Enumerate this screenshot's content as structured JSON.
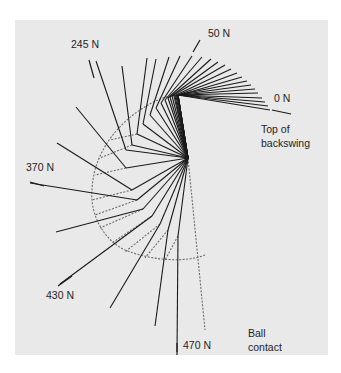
{
  "figure": {
    "background_color": "#e9e9e9",
    "line_color": "#1a1a1a",
    "dotted_color": "#6a6a6a"
  },
  "labels": {
    "force_0": "0 N",
    "force_50": "50 N",
    "force_245": "245 N",
    "force_370": "370 N",
    "force_430": "430 N",
    "force_470": "470 N",
    "top_of_backswing_line1": "Top of",
    "top_of_backswing_line2": "backswing",
    "ball_contact_line1": "Ball",
    "ball_contact_line2": "contact"
  },
  "swing": {
    "hub": [
      188,
      158
    ],
    "positions": [
      {
        "wrist": [
          178,
          95
        ],
        "club": [
          270,
          110
        ]
      },
      {
        "wrist": [
          178,
          95
        ],
        "club": [
          268,
          106
        ]
      },
      {
        "wrist": [
          178,
          95
        ],
        "club": [
          265,
          102
        ]
      },
      {
        "wrist": [
          178,
          95
        ],
        "club": [
          262,
          98
        ]
      },
      {
        "wrist": [
          178,
          95
        ],
        "club": [
          258,
          93
        ]
      },
      {
        "wrist": [
          178,
          95
        ],
        "club": [
          255,
          89
        ]
      },
      {
        "wrist": [
          177,
          95
        ],
        "club": [
          251,
          85
        ]
      },
      {
        "wrist": [
          177,
          95
        ],
        "club": [
          247,
          81
        ]
      },
      {
        "wrist": [
          176,
          96
        ],
        "club": [
          242,
          77
        ]
      },
      {
        "wrist": [
          175,
          96
        ],
        "club": [
          237,
          73
        ]
      },
      {
        "wrist": [
          174,
          96
        ],
        "club": [
          231,
          69
        ]
      },
      {
        "wrist": [
          172,
          96
        ],
        "club": [
          225,
          65
        ]
      },
      {
        "wrist": [
          170,
          97
        ],
        "club": [
          218,
          62
        ]
      },
      {
        "wrist": [
          168,
          98
        ],
        "club": [
          211,
          59
        ]
      },
      {
        "wrist": [
          165,
          100
        ],
        "club": [
          202,
          57
        ]
      },
      {
        "wrist": [
          161,
          103
        ],
        "club": [
          192,
          56
        ]
      },
      {
        "wrist": [
          156,
          108
        ],
        "club": [
          180,
          56
        ]
      },
      {
        "wrist": [
          150,
          115
        ],
        "club": [
          169,
          57
        ]
      },
      {
        "wrist": [
          143,
          124
        ],
        "club": [
          156,
          59
        ],
        "label": "force_50_line"
      },
      {
        "wrist": [
          137,
          134
        ],
        "club": [
          147,
          58
        ]
      },
      {
        "wrist": [
          132,
          145
        ],
        "club": [
          122,
          66
        ]
      },
      {
        "wrist": [
          126,
          150
        ],
        "club": [
          96,
          61
        ]
      },
      {
        "wrist": [
          126,
          168
        ],
        "club": [
          76,
          107
        ]
      },
      {
        "wrist": [
          132,
          190
        ],
        "club": [
          57,
          143
        ]
      },
      {
        "wrist": [
          137,
          200
        ],
        "club": [
          30,
          183
        ]
      },
      {
        "wrist": [
          143,
          209
        ],
        "club": [
          56,
          232
        ]
      },
      {
        "wrist": [
          152,
          216
        ],
        "club": [
          60,
          284
        ]
      },
      {
        "wrist": [
          160,
          224
        ],
        "club": [
          110,
          308
        ]
      },
      {
        "wrist": [
          168,
          230
        ],
        "club": [
          155,
          326
        ]
      },
      {
        "wrist": [
          178,
          236
        ],
        "club": [
          177,
          352
        ]
      }
    ],
    "dotted_path": "M 205 255 C 188 262, 155 262, 125 250 C 100 238, 90 210, 92 190 C 93 160, 110 130, 140 110 C 155 100, 165 96, 178 95",
    "dotted_spokes": [
      [
        [
          137,
          134
        ],
        [
          110,
          140
        ]
      ],
      [
        [
          132,
          145
        ],
        [
          100,
          158
        ]
      ],
      [
        [
          126,
          168
        ],
        [
          95,
          175
        ]
      ],
      [
        [
          132,
          190
        ],
        [
          92,
          200
        ]
      ],
      [
        [
          137,
          200
        ],
        [
          95,
          215
        ]
      ],
      [
        [
          143,
          209
        ],
        [
          100,
          228
        ]
      ],
      [
        [
          152,
          216
        ],
        [
          112,
          243
        ]
      ],
      [
        [
          160,
          224
        ],
        [
          125,
          252
        ]
      ],
      [
        [
          168,
          230
        ],
        [
          145,
          258
        ]
      ],
      [
        [
          178,
          236
        ],
        [
          165,
          260
        ]
      ],
      [
        [
          188,
          158
        ],
        [
          205,
          330
        ]
      ]
    ]
  }
}
